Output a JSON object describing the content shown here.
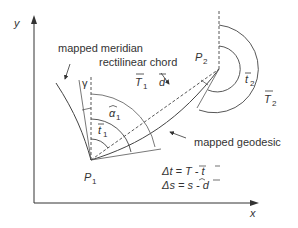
{
  "axes": {
    "x_label": "x",
    "y_label": "y"
  },
  "points": {
    "p1": {
      "label": "P",
      "sub": "1"
    },
    "p2": {
      "label": "P",
      "sub": "2"
    }
  },
  "labels": {
    "mapped_meridian": "mapped meridian",
    "rectilinear_chord": "rectilinear chord",
    "mapped_geodesic": "mapped geodesic",
    "gamma": "γ",
    "T1": {
      "main": "T",
      "sub": "1"
    },
    "d": "d",
    "alpha1": {
      "main": "α",
      "sub": "1"
    },
    "t1": {
      "main": "t",
      "sub": "1"
    },
    "t2": {
      "main": "t",
      "sub": "2"
    },
    "T2": {
      "main": "T",
      "sub": "2"
    }
  },
  "equations": {
    "delta_t": "Δt = T - t",
    "delta_s": "Δs = s - d"
  },
  "colors": {
    "line": "#333333",
    "background": "#ffffff"
  }
}
